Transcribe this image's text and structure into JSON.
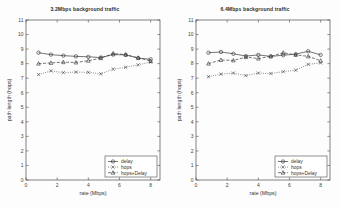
{
  "figure": {
    "background": "#fdfdfd",
    "axis_color": "#4a4a4a",
    "width": 340,
    "height": 208
  },
  "chart_data": [
    {
      "type": "line",
      "title": "3.2Mbps background traffic",
      "xlabel": "rate (Mbps)",
      "ylabel": "path length (hops)",
      "xlim": [
        0,
        8.6
      ],
      "ylim": [
        0,
        11
      ],
      "xticks": [
        0,
        2,
        4,
        6,
        8
      ],
      "xtick_labels": [
        "0",
        "2",
        "4",
        "6",
        "8"
      ],
      "yticks": [
        0,
        1,
        2,
        3,
        4,
        5,
        6,
        7,
        8,
        9,
        10,
        11
      ],
      "ytick_labels": [
        "0",
        "1",
        "2",
        "3",
        "4",
        "5",
        "6",
        "7",
        "8",
        "9",
        "10",
        "11"
      ],
      "grid": false,
      "legend_position": "lower right",
      "x": [
        0.8,
        1.6,
        2.4,
        3.2,
        4.0,
        4.8,
        5.6,
        6.4,
        7.2,
        8.0
      ],
      "series": [
        {
          "name": "delay",
          "marker": "circle",
          "line": "solid",
          "color": "#2b2b2b",
          "values": [
            8.75,
            8.62,
            8.55,
            8.5,
            8.47,
            8.42,
            8.62,
            8.6,
            8.38,
            8.3
          ]
        },
        {
          "name": "hops",
          "marker": "x",
          "line": "dotted",
          "color": "#3a3a3a",
          "values": [
            7.25,
            7.5,
            7.38,
            7.42,
            7.4,
            7.3,
            7.62,
            7.75,
            7.92,
            8.1
          ]
        },
        {
          "name": "hops+Delay",
          "marker": "triangle",
          "line": "dashed",
          "color": "#2b2b2b",
          "values": [
            8.0,
            8.05,
            8.1,
            8.08,
            8.2,
            8.38,
            8.7,
            8.62,
            8.4,
            8.18
          ]
        }
      ]
    },
    {
      "type": "line",
      "title": "6.4Mbps background traffic",
      "xlabel": "rate (Mbps)",
      "ylabel": "path length (hops)",
      "xlim": [
        0,
        8.6
      ],
      "ylim": [
        0,
        11
      ],
      "xticks": [
        0,
        2,
        4,
        6,
        8
      ],
      "xtick_labels": [
        "0",
        "2",
        "4",
        "6",
        "8"
      ],
      "yticks": [
        0,
        1,
        2,
        3,
        4,
        5,
        6,
        7,
        8,
        9,
        10,
        11
      ],
      "ytick_labels": [
        "0",
        "1",
        "2",
        "3",
        "4",
        "5",
        "6",
        "7",
        "8",
        "9",
        "10",
        "11"
      ],
      "grid": false,
      "legend_position": "lower right",
      "x": [
        0.8,
        1.6,
        2.4,
        3.2,
        4.0,
        4.8,
        5.6,
        6.4,
        7.2,
        8.0
      ],
      "series": [
        {
          "name": "delay",
          "marker": "circle",
          "line": "solid",
          "color": "#2b2b2b",
          "values": [
            8.75,
            8.8,
            8.68,
            8.52,
            8.6,
            8.5,
            8.58,
            8.65,
            8.85,
            8.6
          ]
        },
        {
          "name": "hops",
          "marker": "x",
          "line": "dotted",
          "color": "#3a3a3a",
          "values": [
            7.1,
            7.28,
            7.35,
            7.18,
            7.35,
            7.32,
            7.45,
            7.55,
            7.95,
            8.05
          ]
        },
        {
          "name": "hops+Delay",
          "marker": "triangle",
          "line": "dashed",
          "color": "#2b2b2b",
          "values": [
            8.0,
            8.25,
            8.22,
            8.45,
            8.35,
            8.5,
            8.75,
            8.6,
            8.5,
            8.2
          ]
        }
      ]
    }
  ]
}
